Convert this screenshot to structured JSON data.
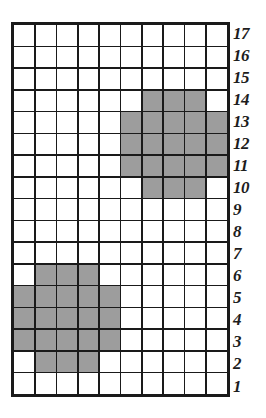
{
  "figure": {
    "type": "grid-diagram",
    "columns": 10,
    "rows": 17,
    "shaded_color": "#9d9d9d",
    "empty_color": "#ffffff",
    "gridline_color": "#1a1a1a",
    "label_color": "#1d1d1d"
  },
  "row_labels": [
    "17",
    "16",
    "15",
    "14",
    "13",
    "12",
    "11",
    "10",
    "9",
    "8",
    "7",
    "6",
    "5",
    "4",
    "3",
    "2",
    "1"
  ],
  "chart_data": {
    "type": "heatmap",
    "title": "",
    "xlabel": "",
    "ylabel": "",
    "grid": true,
    "legend": "none",
    "columns": 10,
    "rows": 17,
    "row_order_top_to_bottom": [
      17,
      16,
      15,
      14,
      13,
      12,
      11,
      10,
      9,
      8,
      7,
      6,
      5,
      4,
      3,
      2,
      1
    ],
    "row_tick_labels": [
      "17",
      "16",
      "15",
      "14",
      "13",
      "12",
      "11",
      "10",
      "9",
      "8",
      "7",
      "6",
      "5",
      "4",
      "3",
      "2",
      "1"
    ],
    "values_top_to_bottom": [
      [
        0,
        0,
        0,
        0,
        0,
        0,
        0,
        0,
        0,
        0
      ],
      [
        0,
        0,
        0,
        0,
        0,
        0,
        0,
        0,
        0,
        0
      ],
      [
        0,
        0,
        0,
        0,
        0,
        0,
        0,
        0,
        0,
        0
      ],
      [
        0,
        0,
        0,
        0,
        0,
        0,
        1,
        1,
        1,
        0
      ],
      [
        0,
        0,
        0,
        0,
        0,
        1,
        1,
        1,
        1,
        1
      ],
      [
        0,
        0,
        0,
        0,
        0,
        1,
        1,
        1,
        1,
        1
      ],
      [
        0,
        0,
        0,
        0,
        0,
        1,
        1,
        1,
        1,
        1
      ],
      [
        0,
        0,
        0,
        0,
        0,
        0,
        1,
        1,
        1,
        0
      ],
      [
        0,
        0,
        0,
        0,
        0,
        0,
        0,
        0,
        0,
        0
      ],
      [
        0,
        0,
        0,
        0,
        0,
        0,
        0,
        0,
        0,
        0
      ],
      [
        0,
        0,
        0,
        0,
        0,
        0,
        0,
        0,
        0,
        0
      ],
      [
        0,
        1,
        1,
        1,
        0,
        0,
        0,
        0,
        0,
        0
      ],
      [
        1,
        1,
        1,
        1,
        1,
        0,
        0,
        0,
        0,
        0
      ],
      [
        1,
        1,
        1,
        1,
        1,
        0,
        0,
        0,
        0,
        0
      ],
      [
        1,
        1,
        1,
        1,
        1,
        0,
        0,
        0,
        0,
        0
      ],
      [
        0,
        1,
        1,
        1,
        0,
        0,
        0,
        0,
        0,
        0
      ],
      [
        0,
        0,
        0,
        0,
        0,
        0,
        0,
        0,
        0,
        0
      ]
    ],
    "shaded_cells_by_row": [
      {
        "row": 14,
        "columns": [
          7,
          8,
          9
        ]
      },
      {
        "row": 13,
        "columns": [
          6,
          7,
          8,
          9,
          10
        ]
      },
      {
        "row": 12,
        "columns": [
          6,
          7,
          8,
          9,
          10
        ]
      },
      {
        "row": 11,
        "columns": [
          6,
          7,
          8,
          9,
          10
        ]
      },
      {
        "row": 10,
        "columns": [
          7,
          8,
          9
        ]
      },
      {
        "row": 6,
        "columns": [
          2,
          3,
          4
        ]
      },
      {
        "row": 5,
        "columns": [
          1,
          2,
          3,
          4,
          5
        ]
      },
      {
        "row": 4,
        "columns": [
          1,
          2,
          3,
          4,
          5
        ]
      },
      {
        "row": 3,
        "columns": [
          1,
          2,
          3,
          4,
          5
        ]
      },
      {
        "row": 2,
        "columns": [
          2,
          3,
          4
        ]
      }
    ],
    "shapes": [
      {
        "name": "upper-shape",
        "rows": [
          10,
          14
        ],
        "columns": [
          6,
          10
        ],
        "cell_count": 21
      },
      {
        "name": "lower-shape",
        "rows": [
          2,
          6
        ],
        "columns": [
          1,
          5
        ],
        "cell_count": 21
      }
    ],
    "total_shaded_cells": 42,
    "total_cells": 170
  }
}
